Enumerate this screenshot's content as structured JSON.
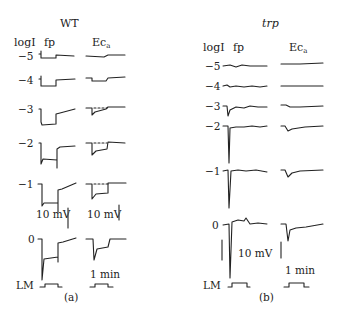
{
  "figure": {
    "panels": [
      {
        "id": "a",
        "caption": "(a)",
        "title": "WT",
        "row_header": "logI",
        "col_headers": {
          "fp": "fp",
          "ec_main": "Ec",
          "ec_sub": "a"
        },
        "rows": [
          "−5",
          "−4",
          "−3",
          "−2",
          "−1",
          "0"
        ],
        "scale_bars": {
          "fp_voltage": "10 mV",
          "ec_voltage": "10 mV",
          "time": "1 min"
        },
        "stimulus_label": "LM"
      },
      {
        "id": "b",
        "caption": "(b)",
        "title": "trp",
        "row_header": "logI",
        "col_headers": {
          "fp": "fp",
          "ec_main": "Ec",
          "ec_sub": "a"
        },
        "rows": [
          "−5",
          "−4",
          "−3",
          "−2",
          "−1",
          "0"
        ],
        "scale_bars": {
          "voltage": "10 mV",
          "time": "1 min"
        },
        "stimulus_label": "LM"
      }
    ]
  }
}
